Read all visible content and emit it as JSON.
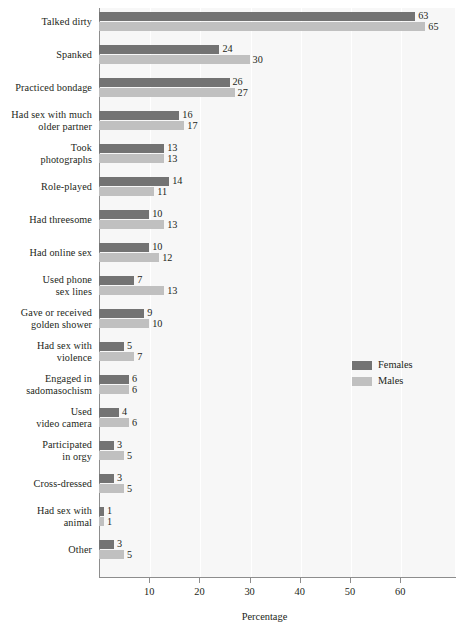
{
  "chart_data": {
    "type": "bar",
    "orientation": "horizontal",
    "title": "",
    "subtitle": "",
    "xlabel": "Percentage",
    "ylabel": "",
    "xlim": [
      0,
      70.5
    ],
    "xticks": [
      10,
      20,
      30,
      40,
      50,
      60
    ],
    "grid": "faint vertical gridlines at x ticks",
    "legend_position": "inside plot, center-right",
    "categories": [
      "Talked dirty",
      "Spanked",
      "Practiced bondage",
      "Had sex with much older partner",
      "Took photographs",
      "Role-played",
      "Had threesome",
      "Had online sex",
      "Used phone sex lines",
      "Gave or received golden shower",
      "Had sex with violence",
      "Engaged in sadomasochism",
      "Used video camera",
      "Participated in orgy",
      "Cross-dressed",
      "Had sex with animal",
      "Other"
    ],
    "category_lines": [
      [
        "Talked dirty"
      ],
      [
        "Spanked"
      ],
      [
        "Practiced bondage"
      ],
      [
        "Had sex with much",
        "older partner"
      ],
      [
        "Took",
        "photographs"
      ],
      [
        "Role-played"
      ],
      [
        "Had threesome"
      ],
      [
        "Had online sex"
      ],
      [
        "Used phone",
        "sex lines"
      ],
      [
        "Gave or received",
        "golden shower"
      ],
      [
        "Had sex with",
        "violence"
      ],
      [
        "Engaged in",
        "sadomasochism"
      ],
      [
        "Used",
        "video camera"
      ],
      [
        "Participated",
        "in orgy"
      ],
      [
        "Cross-dressed"
      ],
      [
        "Had sex with",
        "animal"
      ],
      [
        "Other"
      ]
    ],
    "series": [
      {
        "name": "Females",
        "color": "#737373",
        "values": [
          63,
          24,
          26,
          16,
          13,
          14,
          10,
          10,
          7,
          9,
          5,
          6,
          4,
          3,
          3,
          1,
          3
        ]
      },
      {
        "name": "Males",
        "color": "#c0c0c0",
        "values": [
          65,
          30,
          27,
          17,
          13,
          11,
          13,
          12,
          13,
          10,
          7,
          6,
          6,
          5,
          5,
          1,
          5
        ]
      }
    ]
  },
  "legend": {
    "items": [
      {
        "label": "Females",
        "color": "#737373"
      },
      {
        "label": "Males",
        "color": "#c0c0c0"
      }
    ]
  },
  "axis": {
    "x_title": "Percentage",
    "tick_labels": [
      "10",
      "20",
      "30",
      "40",
      "50",
      "60"
    ]
  },
  "colors": {
    "females": "#737373",
    "males": "#c0c0c0",
    "plot_background": "#f7f7f7",
    "axis_line": "#8d8d8d",
    "text": "#231f20"
  }
}
